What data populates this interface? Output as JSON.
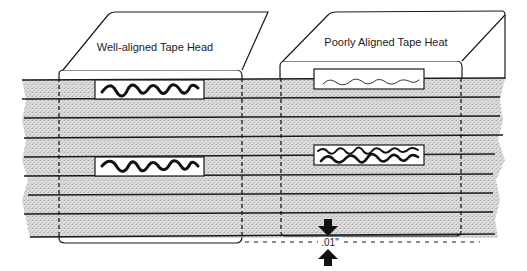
{
  "diagram": {
    "type": "tape-head-alignment-illustration",
    "colors": {
      "tape_fill": "#d9d9d9",
      "track_line": "#1a1a1a",
      "head_outline": "#1a1a1a",
      "background": "#ffffff"
    },
    "tape": {
      "x_left": 22,
      "x_right": 505,
      "y_top": 80,
      "y_bottom": 238,
      "track_lines_y": [
        80,
        99,
        118,
        138,
        157,
        176,
        195,
        214,
        237
      ]
    },
    "heads": [
      {
        "id": "well-aligned",
        "label": "Well-aligned Tape Head",
        "gap_signal": "clean, strong wave centered on track",
        "gaps": [
          {
            "track": "upper",
            "y": 80,
            "h": 19,
            "signal": "strong"
          },
          {
            "track": "lower",
            "y": 157,
            "h": 19,
            "signal": "strong"
          }
        ]
      },
      {
        "id": "poorly-aligned",
        "label": "Poorly Aligned Tape Heat",
        "gap_signal": "weak / crosstalk from adjacent track",
        "gaps": [
          {
            "track": "upper",
            "y": 69,
            "h": 20,
            "signal": "weak"
          },
          {
            "track": "lower",
            "y": 145,
            "h": 20,
            "signal": "mixed crosstalk"
          }
        ]
      }
    ],
    "offset_dimension": {
      "label": ".01\"",
      "description": "misalignment offset indicated by arrows"
    }
  }
}
